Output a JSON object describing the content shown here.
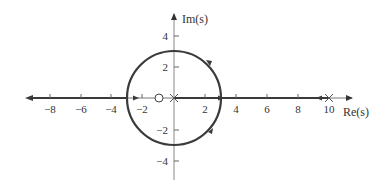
{
  "axes": {
    "x_label": "Re(s)",
    "y_label": "Im(s)",
    "x_ticks": [
      "−8",
      "−6",
      "−4",
      "−2",
      "2",
      "4",
      "6",
      "8",
      "10"
    ],
    "y_ticks": [
      "4",
      "2",
      "−2",
      "−4"
    ]
  },
  "markers": {
    "zero": {
      "symbol": "○",
      "re": -1,
      "im": 0
    },
    "poles": [
      {
        "symbol": "×",
        "re": 0,
        "im": 0
      },
      {
        "symbol": "×",
        "re": 10,
        "im": 0
      }
    ]
  },
  "locus": {
    "circle": {
      "center_re": 0,
      "center_im": 0,
      "radius": 3
    },
    "real_axis_segments": [
      [
        -9.5,
        -3
      ],
      [
        0,
        10
      ]
    ]
  },
  "colors": {
    "locus": "#3a3a3a",
    "axis": "#777777"
  }
}
